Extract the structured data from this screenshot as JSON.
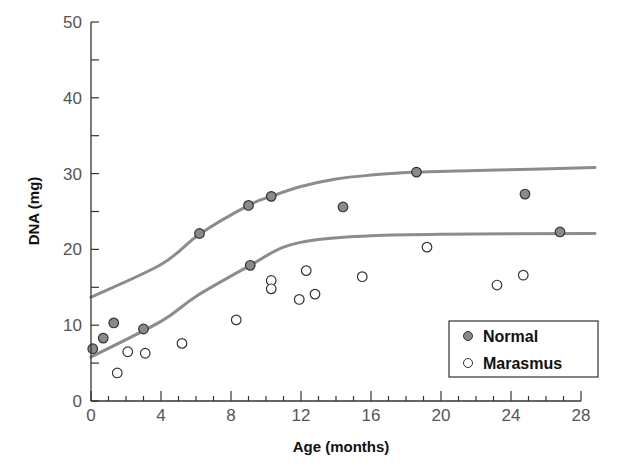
{
  "chart_data": {
    "type": "scatter",
    "title": "",
    "xlabel": "Age (months)",
    "ylabel": "DNA (mg)",
    "xlim": [
      0,
      28
    ],
    "ylim": [
      0,
      50
    ],
    "xticks": [
      0,
      4,
      8,
      12,
      16,
      20,
      24,
      28
    ],
    "yticks": [
      0,
      10,
      20,
      30,
      40,
      50
    ],
    "grid": false,
    "legend_position": "lower right",
    "series": [
      {
        "name": "Normal",
        "marker": "filled-circle",
        "color": "#8a8a8a",
        "points": [
          [
            0.1,
            6.9
          ],
          [
            0.7,
            8.3
          ],
          [
            1.3,
            10.3
          ],
          [
            3.0,
            9.5
          ],
          [
            6.2,
            22.1
          ],
          [
            9.0,
            25.8
          ],
          [
            10.3,
            27.0
          ],
          [
            14.4,
            25.6
          ],
          [
            9.1,
            17.9
          ],
          [
            18.6,
            30.2
          ],
          [
            24.8,
            27.3
          ],
          [
            26.8,
            22.3
          ]
        ],
        "fit_curve": [
          [
            0,
            13.7
          ],
          [
            4,
            18.0
          ],
          [
            6.2,
            22.0
          ],
          [
            9.0,
            25.8
          ],
          [
            10.3,
            27.0
          ],
          [
            12,
            28.3
          ],
          [
            14,
            29.3
          ],
          [
            16,
            29.8
          ],
          [
            18.6,
            30.2
          ],
          [
            22,
            30.4
          ],
          [
            28.8,
            30.8
          ]
        ]
      },
      {
        "name": "Marasmus",
        "marker": "open-circle",
        "color": "#ffffff",
        "points": [
          [
            1.5,
            3.7
          ],
          [
            2.1,
            6.5
          ],
          [
            3.1,
            6.3
          ],
          [
            5.2,
            7.6
          ],
          [
            8.3,
            10.7
          ],
          [
            10.3,
            15.9
          ],
          [
            10.3,
            14.8
          ],
          [
            11.9,
            13.4
          ],
          [
            12.3,
            17.2
          ],
          [
            12.8,
            14.1
          ],
          [
            15.5,
            16.4
          ],
          [
            19.2,
            20.3
          ],
          [
            23.2,
            15.3
          ],
          [
            24.7,
            16.6
          ]
        ],
        "fit_curve": [
          [
            0,
            5.8
          ],
          [
            4,
            10.5
          ],
          [
            6,
            13.8
          ],
          [
            9.1,
            17.9
          ],
          [
            11,
            20.3
          ],
          [
            13,
            21.3
          ],
          [
            16,
            21.8
          ],
          [
            20,
            22.0
          ],
          [
            28.8,
            22.1
          ]
        ]
      }
    ]
  },
  "axes": {
    "x_title": "Age (months)",
    "y_title": "DNA (mg)"
  },
  "legend": {
    "items": [
      "Normal",
      "Marasmus"
    ]
  },
  "colors": {
    "axis": "#333333",
    "curve": "#8c8c8c",
    "filled_marker": "#8a8a8a",
    "marker_stroke": "#333333"
  }
}
